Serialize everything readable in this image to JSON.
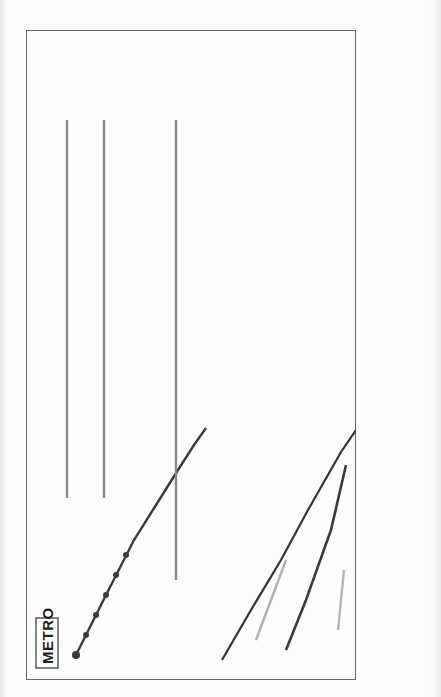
{
  "map": {
    "title": "METRO",
    "orientation": "rotated-90-ccw",
    "colors": {
      "dark_line": "#3a3a3a",
      "medium_line": "#6e6e6e",
      "light_line": "#9a9a9a",
      "pale_line": "#b8b8b8",
      "frame": "#555555"
    },
    "terminals": [
      {
        "en": "Planernaya",
        "ru": "Планерная"
      },
      {
        "en": "Rechnoy Vokzal",
        "ru": "Речной Вокзал"
      },
      {
        "en": "Altufevo",
        "ru": "Алтуфьево"
      },
      {
        "en": "Medvedkovo",
        "ru": "Медведково"
      },
      {
        "en": "Ulitsa Podbelskovo",
        "ru": "Улица Подбельского"
      },
      {
        "en": "Shchelkovskaya",
        "ru": "Щелковская"
      },
      {
        "en": "Novogireevo",
        "ru": "Новогиреево"
      },
      {
        "en": "Krylatskoe",
        "ru": "Крылатское"
      }
    ],
    "lines": {
      "planernaya_line": [
        {
          "en": "Planernaya",
          "ru": "Планерная"
        },
        {
          "en": "Skhodnenskaya",
          "ru": "Сходненская"
        },
        {
          "en": "Tushinskaya",
          "ru": "Тушинская"
        },
        {
          "en": "Shchukinskaya",
          "ru": "Щукинская"
        },
        {
          "en": "Oktyabrskoe Pole",
          "ru": "Октябрьское Поле"
        },
        {
          "en": "Polezhaevskaya",
          "ru": "Полежаевская"
        },
        {
          "en": "Begovaya",
          "ru": "Беговая"
        },
        {
          "en": "Ulitsa 1905 Goda",
          "ru": "Улица 1905 Года"
        },
        {
          "en": "Barrikadnaya",
          "ru": "Баррикадная"
        }
      ],
      "rechnoy_line": [
        {
          "en": "Rechnoy Vokzal",
          "ru": "Речной Вокзал"
        },
        {
          "en": "Vodny Stadion",
          "ru": "Водный Стадион"
        },
        {
          "en": "Voykovskaya",
          "ru": "Войковская"
        },
        {
          "en": "Sokol",
          "ru": "Сокол"
        },
        {
          "en": "Aeroport",
          "ru": "Аэропорт"
        },
        {
          "en": "Dinamo",
          "ru": "Динамо"
        },
        {
          "en": "Belorusskaya",
          "ru": "Белорусская"
        },
        {
          "en": "Mayakovskaya",
          "ru": "Маяковская"
        },
        {
          "en": "Tverskaya",
          "ru": "Тверская"
        },
        {
          "en": "Teatralnaya",
          "ru": "Театральная"
        }
      ],
      "altufevo_line": [
        {
          "en": "Altufevo",
          "ru": "Алтуфьево"
        },
        {
          "en": "Bibirevo",
          "ru": "Бибирево"
        },
        {
          "en": "Otradnoe",
          "ru": "Отрадное"
        },
        {
          "en": "Vladykino",
          "ru": "Владыкино"
        },
        {
          "en": "Petrovsko-Razumovskaya",
          "ru": "Петровско-Разумовская"
        },
        {
          "en": "Timiryazevskaya",
          "ru": "Тимирязевская"
        },
        {
          "en": "Dmitrovskaya",
          "ru": "Дмитровская"
        },
        {
          "en": "Savelovskaya",
          "ru": "Савеловская"
        },
        {
          "en": "Mendeleevskaya",
          "ru": "Менделеевская"
        },
        {
          "en": "Tsvetnoy Bulvar",
          "ru": "Цветной Бульвар"
        },
        {
          "en": "Chekhovskaya",
          "ru": "Чеховская"
        }
      ],
      "medvedkovo_line": [
        {
          "en": "Medvedkovo",
          "ru": "Медведково"
        },
        {
          "en": "Babushkinskaya",
          "ru": "Бабушкинская"
        },
        {
          "en": "Sviblovo",
          "ru": "Свиблово"
        },
        {
          "en": "Botanicheskiy Sad",
          "ru": "Ботанический Сад"
        },
        {
          "en": "VDNKh",
          "ru": "ВДНХ"
        },
        {
          "en": "Alekseevskaya",
          "ru": "Алексеевская"
        },
        {
          "en": "Rizhskaya",
          "ru": "Рижская"
        },
        {
          "en": "Prospect Mira",
          "ru": "Проспект Мира"
        },
        {
          "en": "Sukharevskaya",
          "ru": "Сухаревская"
        },
        {
          "en": "Turgenevskaya",
          "ru": "Тургеневская"
        },
        {
          "en": "Kitay-Gorod",
          "ru": "Китай-Город"
        }
      ],
      "sokolnicheskaya_line": [
        {
          "en": "Ulitsa Podbelskovo",
          "ru": "Улица Подбельского"
        },
        {
          "en": "Cherkizovskaya",
          "ru": "Черкизовская"
        },
        {
          "en": "Preobrazhenskaya Ploshchad",
          "ru": "Преображенская Площадь"
        },
        {
          "en": "Sokolniki",
          "ru": "Сокольники"
        },
        {
          "en": "Krasnoselskaya",
          "ru": "Красносельская"
        },
        {
          "en": "Komsomolskaya",
          "ru": "Комсомольская"
        },
        {
          "en": "Krasnye Vorota",
          "ru": "Красные Ворота"
        },
        {
          "en": "Chistye Prudy",
          "ru": "Чистые Пруды"
        },
        {
          "en": "Lubyanka",
          "ru": "Лубянка"
        },
        {
          "en": "Okhotny Ryad",
          "ru": "Охотный Ряд"
        }
      ],
      "shchelkovskaya_line": [
        {
          "en": "Shchelkovskaya",
          "ru": "Щелковская"
        },
        {
          "en": "Pervomayskaya",
          "ru": "Первомайская"
        },
        {
          "en": "Izmaylovskiy Park",
          "ru": "Измайловский Парк"
        },
        {
          "en": "Izmaylovskaya",
          "ru": "Измайловская"
        },
        {
          "en": "Semyonovskaya",
          "ru": "Семёновская"
        },
        {
          "en": "Elektrozavodskaya",
          "ru": "Электрозаводская"
        },
        {
          "en": "Baumanskaya",
          "ru": "Бауманская"
        },
        {
          "en": "Kurskaya",
          "ru": "Курская"
        }
      ],
      "novogireevo_line": [
        {
          "en": "Novogireevo",
          "ru": "Новогиреево"
        },
        {
          "en": "Perovo",
          "ru": "Перово"
        },
        {
          "en": "Shosse Entuziastov",
          "ru": "Шоссе Энтузиастов"
        },
        {
          "en": "Aviamotornaya",
          "ru": "Авиамоторная"
        },
        {
          "en": "Ploshchad Ilicha",
          "ru": "Площадь Ильича"
        }
      ],
      "krylatskoe_line": [
        {
          "en": "Krylatskoe",
          "ru": "Крылатское"
        },
        {
          "en": "Molodezhnaya",
          "ru": "Молодёжная"
        },
        {
          "en": "Kuntsevskaya",
          "ru": "Кунцевская"
        },
        {
          "en": "Pionerskaya",
          "ru": "Пионерская"
        },
        {
          "en": "Filyovsky Park",
          "ru": "Филёвский Парк"
        },
        {
          "en": "Bagrationovskaya",
          "ru": "Багратионовская"
        },
        {
          "en": "Fili",
          "ru": "Фили"
        },
        {
          "en": "Kutuzovskaya",
          "ru": "Кутузовская"
        },
        {
          "en": "Studencheskaya",
          "ru": "Студенческая"
        },
        {
          "en": "Kievskaya",
          "ru": "Киевская"
        },
        {
          "en": "Smolenskaya",
          "ru": "Смоленская"
        },
        {
          "en": "Arbatskaya",
          "ru": "Арбатская"
        }
      ],
      "park_pobedy_line": [
        {
          "en": "Park Pobedy",
          "ru": "Парк Победы"
        },
        {
          "en": "Kievskaya",
          "ru": "Киевская"
        },
        {
          "en": "Smolenskaya",
          "ru": "Смоленская"
        }
      ],
      "dashed_line": [
        {
          "en": "Marina Roshcha",
          "ru": "Марьина Роща"
        },
        {
          "en": "Dostoevskaya",
          "ru": "Достоевская"
        },
        {
          "en": "Trubnaya",
          "ru": "Трубная"
        },
        {
          "en": "Sretensky Bulvar",
          "ru": "Сретенский Бульвар"
        }
      ],
      "ring_line": [
        {
          "en": "Belorusskaya",
          "ru": "Белорусская"
        },
        {
          "en": "Novoslobodskaya",
          "ru": "Новослободская"
        },
        {
          "en": "Prospect Mira",
          "ru": "Проспект Мира"
        },
        {
          "en": "Komsomolskaya",
          "ru": "Комсомольская"
        },
        {
          "en": "Kurskaya",
          "ru": "Курская"
        },
        {
          "en": "Krasnopresnenskaya",
          "ru": "Краснопресненская"
        },
        {
          "en": "Kievskaya",
          "ru": "Киевская"
        }
      ],
      "other_labels": [
        {
          "en": "Ploshchad Suvorova",
          "ru": "Площадь Суворова"
        },
        {
          "en": "Kuznetsky Most",
          "ru": "Кузнецкий Мост"
        },
        {
          "en": "Pushkinskaya",
          "ru": "Пушкинская"
        },
        {
          "en": "Chkalovskaya",
          "ru": "Чкаловская"
        }
      ]
    }
  }
}
